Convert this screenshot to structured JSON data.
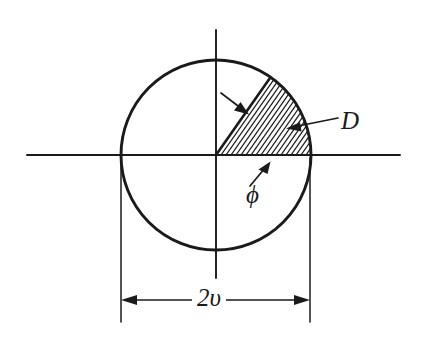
{
  "figure": {
    "background_color": "#ffffff",
    "ink_color": "#1a1a1a",
    "labels": {
      "region": "D",
      "angle": "ϕ",
      "diameter": "2υ"
    },
    "geometry": {
      "center_x": 216,
      "center_y": 155,
      "radius": 95,
      "sector_start_angle_deg": 0,
      "sector_end_angle_deg": 55,
      "hatch_line_count": 19,
      "hatch_angle_deg": 55,
      "horizontal_axis": {
        "x1": 27,
        "y1": 155,
        "x2": 400,
        "y2": 155
      },
      "vertical_axis": {
        "x1": 216,
        "y1": 30,
        "x2": 216,
        "y2": 278
      },
      "dimension_line": {
        "x1": 121,
        "x2": 310,
        "y": 300
      },
      "extension_left_x": 121,
      "extension_right_x": 310,
      "extension_top_y": 155,
      "extension_bottom_y": 322
    },
    "annotations": {
      "region_leader": {
        "name": "D",
        "from_x": 338,
        "from_y": 118,
        "to_x": 289,
        "to_y": 128
      },
      "radius_arrow": {
        "from_x": 222,
        "from_y": 94,
        "to_x": 246,
        "to_y": 112
      },
      "angle_arrow": {
        "from_x": 252,
        "from_y": 185,
        "to_x": 268,
        "to_y": 164
      }
    }
  }
}
